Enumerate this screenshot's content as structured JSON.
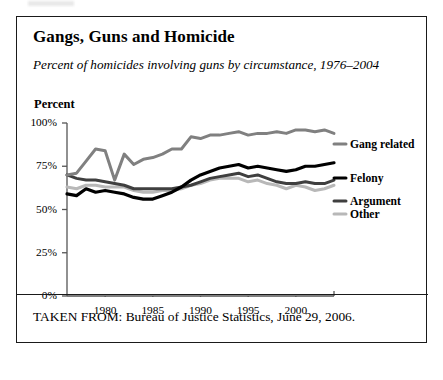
{
  "figure": {
    "title": "Gangs, Guns and Homicide",
    "subtitle": "Percent of homicides involving guns by circumstance, 1976–2004",
    "axis_title": "Percent",
    "source_note": "TAKEN FROM: Bureau of Justice Statistics, June 29, 2006."
  },
  "colors": {
    "gang_related": "#808080",
    "felony": "#000000",
    "argument": "#3f3f3f",
    "other": "#b8b8b8",
    "frame": "#1a1a1a",
    "axis": "#555555",
    "background": "#ffffff"
  },
  "legend": {
    "gang_related": "Gang related",
    "felony": "Felony",
    "argument": "Argument",
    "other": "Other"
  },
  "chart_data": {
    "type": "line",
    "title": "Gangs, Guns and Homicide",
    "subtitle": "Percent of homicides involving guns by circumstance, 1976–2004",
    "xlabel": "",
    "ylabel": "Percent",
    "xlim": [
      1976,
      2004
    ],
    "ylim": [
      0,
      100
    ],
    "grid": false,
    "legend_position": "right",
    "x": [
      1976,
      1977,
      1978,
      1979,
      1980,
      1981,
      1982,
      1983,
      1984,
      1985,
      1986,
      1987,
      1988,
      1989,
      1990,
      1991,
      1992,
      1993,
      1994,
      1995,
      1996,
      1997,
      1998,
      1999,
      2000,
      2001,
      2002,
      2003,
      2004
    ],
    "xticks": [
      1980,
      1985,
      1990,
      1995,
      2000
    ],
    "xtick_labels": [
      "1980",
      "1985",
      "1990",
      "1995",
      "2000"
    ],
    "yticks": [
      0,
      25,
      50,
      75,
      100
    ],
    "ytick_labels": [
      "0%",
      "25%",
      "50%",
      "75%",
      "100%"
    ],
    "series": [
      {
        "name": "Gang related",
        "color": "#808080",
        "values": [
          70,
          71,
          78,
          85,
          84,
          67,
          82,
          76,
          79,
          80,
          82,
          85,
          85,
          92,
          91,
          93,
          93,
          94,
          95,
          93,
          94,
          94,
          95,
          94,
          96,
          96,
          95,
          96,
          94
        ]
      },
      {
        "name": "Felony",
        "color": "#000000",
        "values": [
          59,
          58,
          62,
          60,
          61,
          60,
          59,
          57,
          56,
          56,
          58,
          60,
          63,
          67,
          70,
          72,
          74,
          75,
          76,
          74,
          75,
          74,
          73,
          72,
          73,
          75,
          75,
          76,
          77
        ]
      },
      {
        "name": "Argument",
        "color": "#3f3f3f",
        "values": [
          70,
          68,
          67,
          67,
          66,
          65,
          64,
          62,
          62,
          62,
          62,
          62,
          63,
          64,
          66,
          68,
          69,
          70,
          71,
          69,
          70,
          68,
          66,
          65,
          65,
          66,
          65,
          65,
          67
        ]
      },
      {
        "name": "Other",
        "color": "#b8b8b8",
        "values": [
          63,
          62,
          64,
          64,
          63,
          63,
          63,
          61,
          60,
          60,
          61,
          61,
          62,
          64,
          65,
          67,
          68,
          68,
          68,
          66,
          67,
          65,
          64,
          62,
          64,
          63,
          61,
          62,
          64
        ]
      }
    ]
  }
}
